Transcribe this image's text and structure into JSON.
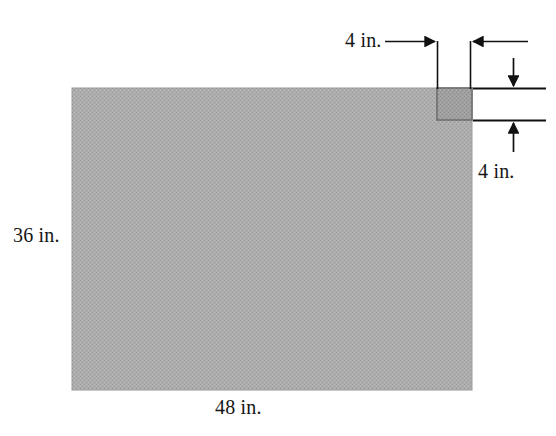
{
  "diagram": {
    "sheet": {
      "width_label": "48 in.",
      "height_label": "36 in.",
      "fill_color": "#a9a9a9",
      "edge_color": "#8f8f8f"
    },
    "corner_square": {
      "horizontal_label": "4 in.",
      "vertical_label": "4 in.",
      "fill_color": "#9d9d9d",
      "edge_color": "#707070"
    },
    "annotation_color": "#111111"
  },
  "labels": {
    "top_width": "4 in.",
    "right_height": "4 in.",
    "left_height": "36 in.",
    "bottom_width": "48 in."
  }
}
